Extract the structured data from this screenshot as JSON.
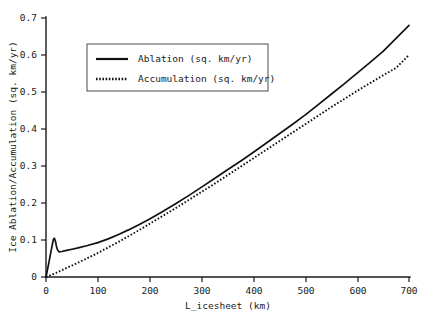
{
  "chart_data": {
    "type": "line",
    "title": "",
    "xlabel": "L_icesheet (km)",
    "ylabel": "Ice Ablation/Accumulation (sq. km/yr)",
    "xlim": [
      0,
      700
    ],
    "ylim": [
      0,
      0.7
    ],
    "xticks": [
      0,
      100,
      200,
      300,
      400,
      500,
      600,
      700
    ],
    "yticks": [
      0,
      0.1,
      0.2,
      0.3,
      0.4,
      0.5,
      0.6,
      0.7
    ],
    "xtick_labels": [
      "0",
      "100",
      "200",
      "300",
      "400",
      "500",
      "600",
      "700"
    ],
    "ytick_labels": [
      "0",
      "0.1",
      "0.2",
      "0.3",
      "0.4",
      "0.5",
      "0.6",
      "0.7"
    ],
    "grid": false,
    "legend_position": "upper-left-inside",
    "series": [
      {
        "name": "Ablation (sq. km/yr)",
        "style": "solid",
        "color": "#111111",
        "x": [
          0,
          5,
          10,
          14,
          16,
          18,
          20,
          22,
          25,
          30,
          40,
          50,
          60,
          80,
          100,
          120,
          140,
          160,
          180,
          200,
          225,
          250,
          275,
          300,
          325,
          350,
          375,
          400,
          425,
          450,
          475,
          500,
          525,
          550,
          575,
          600,
          625,
          650,
          675,
          700
        ],
        "y": [
          0.0,
          0.035,
          0.072,
          0.1,
          0.105,
          0.098,
          0.084,
          0.074,
          0.068,
          0.069,
          0.072,
          0.075,
          0.078,
          0.085,
          0.093,
          0.103,
          0.115,
          0.128,
          0.142,
          0.157,
          0.177,
          0.198,
          0.22,
          0.243,
          0.266,
          0.29,
          0.313,
          0.337,
          0.362,
          0.387,
          0.412,
          0.438,
          0.466,
          0.494,
          0.522,
          0.551,
          0.58,
          0.61,
          0.645,
          0.68
        ]
      },
      {
        "name": "Accumulation (sq. km/yr)",
        "style": "dotted",
        "color": "#111111",
        "x": [
          0,
          10,
          20,
          30,
          40,
          50,
          60,
          80,
          100,
          120,
          140,
          160,
          180,
          200,
          225,
          250,
          275,
          300,
          325,
          350,
          375,
          400,
          425,
          450,
          475,
          500,
          525,
          550,
          575,
          600,
          625,
          650,
          675,
          700
        ],
        "y": [
          0.0,
          0.0055,
          0.0115,
          0.018,
          0.0245,
          0.031,
          0.0375,
          0.051,
          0.065,
          0.08,
          0.095,
          0.111,
          0.127,
          0.144,
          0.165,
          0.186,
          0.208,
          0.23,
          0.252,
          0.275,
          0.298,
          0.321,
          0.344,
          0.367,
          0.39,
          0.413,
          0.436,
          0.459,
          0.481,
          0.503,
          0.524,
          0.545,
          0.565,
          0.6
        ]
      }
    ],
    "annotations": {
      "ablation_peak": {
        "x": 16,
        "y": 0.105
      },
      "ablation_trough": {
        "x": 25,
        "y": 0.068
      },
      "crossing_points": [
        180,
        480
      ]
    }
  },
  "legend": {
    "entries": [
      {
        "label": "Ablation (sq. km/yr)",
        "style": "solid"
      },
      {
        "label": "Accumulation (sq. km/yr)",
        "style": "dotted"
      }
    ]
  },
  "axes": {
    "x_title": "L_icesheet (km)",
    "y_title": "Ice Ablation/Accumulation (sq. km/yr)"
  }
}
